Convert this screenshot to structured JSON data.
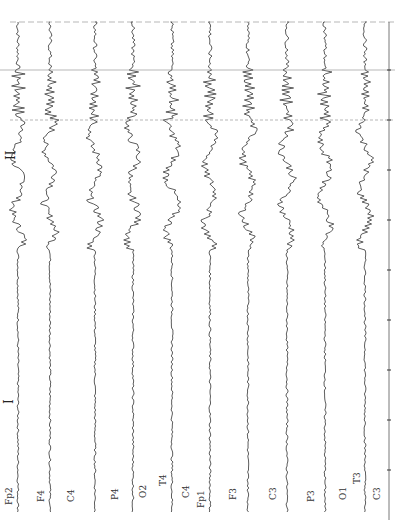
{
  "figure": {
    "segment_labels": [
      "I",
      "II"
    ],
    "channels": [
      "Fp2",
      "F4",
      "C4",
      "P4",
      "O2",
      "T4",
      "C4",
      "Fp1",
      "F3",
      "C3",
      "P3",
      "O1",
      "T3",
      "C3"
    ],
    "montage_rows": [
      {
        "label": "Fp2",
        "x": 18
      },
      {
        "label": "F4",
        "x": 50
      },
      {
        "label": "C4",
        "x": 95
      },
      {
        "label": "P4",
        "x": 133
      },
      {
        "label": "O2",
        "x": 172
      },
      {
        "label": "T4-C4",
        "x": 210
      },
      {
        "label": "Fp1",
        "x": 248
      },
      {
        "label": "F3",
        "x": 287
      },
      {
        "label": "C3",
        "x": 325
      },
      {
        "label": "P3",
        "x": 365
      }
    ],
    "label_texts": {
      "fp2": "Fp2",
      "f4": "F4",
      "c4": "C4",
      "p4": "P4",
      "o2": "O2",
      "t4": "T4",
      "c4b": "C4",
      "fp1": "Fp1",
      "f3": "F3",
      "c3": "C3",
      "p3": "P3",
      "o1": "O1",
      "t3": "T3",
      "c3b": "C3"
    },
    "marker_I": "I",
    "marker_II": "II",
    "colors": {
      "trace": "#333333",
      "background": "#ffffff",
      "timeline": "#555555"
    }
  }
}
